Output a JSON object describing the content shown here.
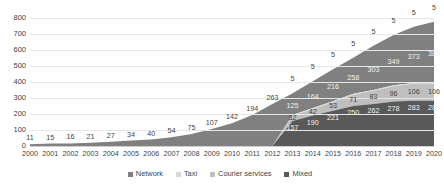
{
  "chart_data": {
    "type": "area",
    "stacked": true,
    "title": "",
    "subtitle": "",
    "xlabel": "",
    "ylabel": "",
    "ylim": [
      0,
      800
    ],
    "grid": true,
    "legend_position": "bottom",
    "yticks": [
      "800",
      "700",
      "600",
      "500",
      "400",
      "300",
      "200",
      "100",
      "0"
    ],
    "categories": [
      "2000",
      "2001",
      "2002",
      "2003",
      "2004",
      "2005",
      "2006",
      "2007",
      "2008",
      "2009",
      "2010",
      "2011",
      "2012",
      "2013",
      "2014",
      "2015",
      "2016",
      "2017",
      "2018",
      "2019",
      "2020"
    ],
    "series": [
      {
        "name": "Network",
        "color": "#808080",
        "values": [
          11,
          15,
          16,
          21,
          27,
          34,
          40,
          54,
          75,
          107,
          142,
          194,
          263,
          330,
          404,
          479,
          552,
          626,
          693,
          745,
          777
        ],
        "labels": [
          "11",
          "15",
          "16",
          "21",
          "27",
          "34",
          "40",
          "54",
          "75",
          "107",
          "142",
          "194",
          "263",
          "",
          "",
          "",
          "",
          "",
          "",
          "",
          ""
        ]
      },
      {
        "name": "Taxi",
        "color": "#d9d9d9",
        "values": [
          0,
          0,
          0,
          0,
          0,
          0,
          0,
          0,
          0,
          0,
          0,
          0,
          0,
          5,
          5,
          5,
          5,
          5,
          5,
          5,
          5
        ],
        "labels": [
          "",
          "",
          "",
          "",
          "",
          "",
          "",
          "",
          "",
          "",
          "",
          "",
          "",
          "5",
          "5",
          "5",
          "5",
          "5",
          "5",
          "5",
          "5"
        ]
      },
      {
        "name": "Courier services",
        "color": "#bfbfbf",
        "values": [
          0,
          0,
          0,
          0,
          0,
          0,
          0,
          0,
          0,
          0,
          0,
          0,
          0,
          32,
          42,
          53,
          71,
          83,
          96,
          106,
          106
        ],
        "labels": [
          "",
          "",
          "",
          "",
          "",
          "",
          "",
          "",
          "",
          "",
          "",
          "",
          "",
          "32",
          "42",
          "53",
          "71",
          "83",
          "96",
          "106",
          "106"
        ]
      },
      {
        "name": "Mixed",
        "color": "#595959",
        "values": [
          0,
          0,
          0,
          0,
          0,
          0,
          0,
          0,
          0,
          0,
          0,
          0,
          0,
          157,
          190,
          221,
          250,
          262,
          278,
          283,
          283
        ],
        "labels": [
          "",
          "",
          "",
          "",
          "",
          "",
          "",
          "",
          "",
          "",
          "",
          "",
          "",
          "157",
          "190",
          "221",
          "250",
          "262",
          "278",
          "283",
          "283"
        ]
      }
    ],
    "upper_band_labels": [
      "",
      "",
      "",
      "",
      "",
      "",
      "",
      "",
      "",
      "",
      "",
      "",
      "",
      "125",
      "164",
      "216",
      "258",
      "303",
      "349",
      "373",
      "383"
    ],
    "annotations": []
  },
  "legend": {
    "items": [
      {
        "label": "Network",
        "color": "#808080"
      },
      {
        "label": "Taxi",
        "color": "#d9d9d9"
      },
      {
        "label": "Courier services",
        "color": "#bfbfbf"
      },
      {
        "label": "Mixed",
        "color": "#595959"
      }
    ]
  },
  "corner": {
    "mark": ""
  }
}
